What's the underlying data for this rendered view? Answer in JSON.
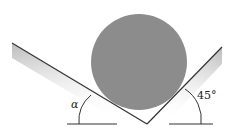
{
  "diagram": {
    "labels": {
      "alpha": "α",
      "right_angle": "45°"
    },
    "colors": {
      "cylinder": "#8c8c8c",
      "lines": "#333333"
    }
  }
}
